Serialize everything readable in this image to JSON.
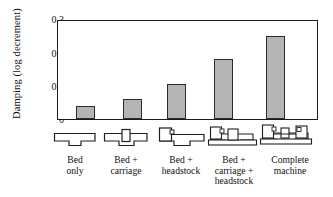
{
  "chart_data": {
    "type": "bar",
    "title": "",
    "xlabel": "",
    "ylabel": "Damping (log decrement)",
    "categories": [
      "Bed only",
      "Bed + carriage",
      "Bed + headstock",
      "Bed + carriage + headstock",
      "Complete machine"
    ],
    "category_lines": [
      [
        "Bed",
        "only"
      ],
      [
        "Bed +",
        "carriage"
      ],
      [
        "Bed +",
        "headstock"
      ],
      [
        "Bed +",
        "carriage +",
        "headstock"
      ],
      [
        "Complete",
        "machine"
      ]
    ],
    "values": [
      0.04,
      0.06,
      0.105,
      0.18,
      0.25
    ],
    "ylim": [
      0,
      0.3
    ],
    "ytick_labels": [
      "0",
      "0.1",
      "0.2",
      "0.3"
    ],
    "ytick_values": [
      0,
      0.1,
      0.2,
      0.3
    ],
    "grid": false,
    "legend": "none",
    "bar_fill": "#b4b4b4",
    "bar_edge": "#2b2b2b",
    "axis_color": "#1a1a1a",
    "background": "#ffffff"
  },
  "pictograms": [
    {
      "name": "bed-only-diagram"
    },
    {
      "name": "bed-carriage-diagram"
    },
    {
      "name": "bed-headstock-diagram"
    },
    {
      "name": "bed-carriage-headstock-diagram"
    },
    {
      "name": "complete-machine-diagram"
    }
  ]
}
